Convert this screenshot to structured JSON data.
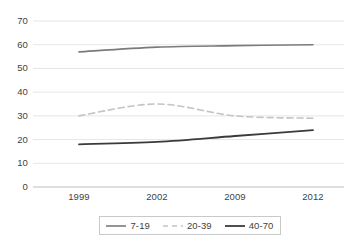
{
  "chart_data": {
    "type": "line",
    "title": "",
    "xlabel": "",
    "ylabel": "",
    "categories": [
      "1999",
      "2002",
      "2009",
      "2012"
    ],
    "ylim": [
      0,
      70
    ],
    "yticks": [
      0,
      10,
      20,
      30,
      40,
      50,
      60,
      70
    ],
    "grid": true,
    "legend_position": "bottom",
    "series": [
      {
        "name": "7-19",
        "values": [
          57,
          59,
          59.6,
          60
        ],
        "color": "#7b7b7b",
        "style": "solid",
        "width": 1.6
      },
      {
        "name": "20-39",
        "values": [
          30,
          35,
          30,
          29
        ],
        "color": "#c4c4c4",
        "style": "dashed",
        "width": 1.6
      },
      {
        "name": "40-70",
        "values": [
          18,
          19,
          21.5,
          24
        ],
        "color": "#3a3a3a",
        "style": "solid",
        "width": 1.8
      }
    ]
  },
  "axes": {
    "y_tick_labels": [
      "70",
      "60",
      "50",
      "40",
      "30",
      "20",
      "10",
      "0"
    ],
    "x_tick_labels": [
      "1999",
      "2002",
      "2009",
      "2012"
    ]
  },
  "legend": {
    "items": [
      {
        "label": "7-19"
      },
      {
        "label": "20-39"
      },
      {
        "label": "40-70"
      }
    ]
  },
  "colors": {
    "gridline": "#e6e6e6",
    "axis": "#bdbdbd",
    "text": "#3f3f3f",
    "legend_border": "#c9c9c9",
    "background": "#ffffff"
  }
}
